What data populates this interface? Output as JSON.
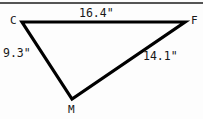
{
  "figure": {
    "type": "triangle",
    "stroke_color": "#000000",
    "background_color": "#fdfdfd",
    "rule_color": "#555555",
    "vertices": [
      {
        "name": "C",
        "label": "C",
        "x": 22,
        "y": 22
      },
      {
        "name": "F",
        "label": "F",
        "x": 185,
        "y": 22
      },
      {
        "name": "M",
        "label": "M",
        "x": 72,
        "y": 99
      }
    ],
    "sides": [
      {
        "name": "CF",
        "label": "16.4\"",
        "value": 16.4,
        "unit": "inches",
        "from": "C",
        "to": "F"
      },
      {
        "name": "CM",
        "label": "9.3\"",
        "value": 9.3,
        "unit": "inches",
        "from": "C",
        "to": "M"
      },
      {
        "name": "MF",
        "label": "14.1\"",
        "value": 14.1,
        "unit": "inches",
        "from": "M",
        "to": "F"
      }
    ]
  }
}
